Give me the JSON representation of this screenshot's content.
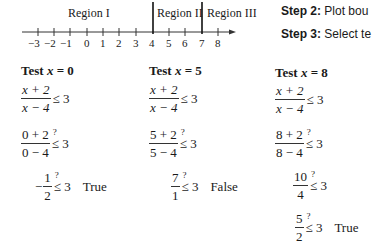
{
  "number_line": {
    "regions": [
      {
        "label": "Region I"
      },
      {
        "label": "Region II"
      },
      {
        "label": "Region III"
      }
    ],
    "ticks": [
      "−3",
      "−2",
      "−1",
      "0",
      "1",
      "2",
      "3",
      "4",
      "5",
      "6",
      "7",
      "8"
    ],
    "boundaries": [
      "4",
      "7"
    ]
  },
  "steps": [
    {
      "label": "Step 2:",
      "text": "Plot bou"
    },
    {
      "label": "Step 3:",
      "text": "Select te"
    }
  ],
  "tests": [
    {
      "title_prefix": "Test ",
      "var": "x",
      "title_suffix": " = 0",
      "inequality": {
        "num": "x + 2",
        "den": "x − 4",
        "rel": "≤ 3"
      },
      "substituted": {
        "num": "0 + 2",
        "den": "0 − 4",
        "rel": "≤ 3",
        "q": "?"
      },
      "simplified": [
        {
          "sign": "−",
          "num": "1",
          "den": "2",
          "rel": "≤ 3",
          "q": "?",
          "verdict": "True"
        }
      ]
    },
    {
      "title_prefix": "Test ",
      "var": "x",
      "title_suffix": " = 5",
      "inequality": {
        "num": "x + 2",
        "den": "x − 4",
        "rel": "≤ 3"
      },
      "substituted": {
        "num": "5 + 2",
        "den": "5 − 4",
        "rel": "≤ 3",
        "q": "?"
      },
      "simplified": [
        {
          "sign": "",
          "num": "7",
          "den": "1",
          "rel": "≤ 3",
          "q": "?",
          "verdict": "False"
        }
      ]
    },
    {
      "title_prefix": "Test ",
      "var": "x",
      "title_suffix": " = 8",
      "inequality": {
        "num": "x + 2",
        "den": "x − 4",
        "rel": "≤ 3"
      },
      "substituted": {
        "num": "8 + 2",
        "den": "8 − 4",
        "rel": "≤ 3",
        "q": "?"
      },
      "simplified": [
        {
          "sign": "",
          "num": "10",
          "den": "4",
          "rel": "≤ 3",
          "q": "?",
          "verdict": ""
        },
        {
          "sign": "",
          "num": "5",
          "den": "2",
          "rel": "≤ 3",
          "q": "?",
          "verdict": "True"
        }
      ]
    }
  ]
}
